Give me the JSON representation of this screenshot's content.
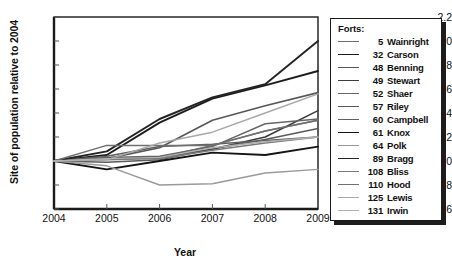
{
  "chart_data": {
    "type": "line",
    "title": "",
    "xlabel": "Year",
    "ylabel": "Site of population relative to 2004",
    "x": [
      2004,
      2005,
      2006,
      2007,
      2008,
      2009
    ],
    "xticklabels": [
      "2004",
      "2005",
      "2006",
      "2007",
      "2008",
      "2009"
    ],
    "yticklabels": [
      "0.6",
      "0.8",
      "1.0",
      "1.2",
      "1.4",
      "1.6",
      "1.8",
      "2.0",
      "2.2"
    ],
    "yticks": [
      0.6,
      0.8,
      1.0,
      1.2,
      1.4,
      1.6,
      1.8,
      2.0,
      2.2
    ],
    "xlim": [
      2004,
      2009
    ],
    "ylim": [
      0.6,
      2.2
    ],
    "grid": false,
    "legend_position": "right-outside",
    "legend_title": "Forts:",
    "series": [
      {
        "name": "5  Wainright",
        "number": "5",
        "fort": "Wainright",
        "color": "#6e6e6e",
        "width": 1.5,
        "values": [
          1.0,
          1.02,
          1.03,
          1.13,
          1.25,
          1.34
        ]
      },
      {
        "name": "32  Carson",
        "number": "32",
        "fort": "Carson",
        "color": "#1c1c1c",
        "width": 1.9,
        "values": [
          1.0,
          1.05,
          1.32,
          1.52,
          1.63,
          1.75
        ]
      },
      {
        "name": "48  Benning",
        "number": "48",
        "fort": "Benning",
        "color": "#5a5a5a",
        "width": 1.5,
        "values": [
          1.0,
          0.99,
          1.01,
          1.1,
          1.18,
          1.27
        ]
      },
      {
        "name": "49  Stewart",
        "number": "49",
        "fort": "Stewart",
        "color": "#3c3c3c",
        "width": 1.6,
        "values": [
          1.0,
          1.02,
          1.03,
          1.1,
          1.2,
          1.42
        ]
      },
      {
        "name": "52  Shaer",
        "number": "52",
        "fort": "Shaer",
        "color": "#666666",
        "width": 1.5,
        "values": [
          1.0,
          1.03,
          1.04,
          1.12,
          1.31,
          1.35
        ]
      },
      {
        "name": "57  Riley",
        "number": "57",
        "fort": "Riley",
        "color": "#575757",
        "width": 1.6,
        "values": [
          1.0,
          1.02,
          1.11,
          1.34,
          1.46,
          1.57
        ]
      },
      {
        "name": "60  Campbell",
        "number": "60",
        "fort": "Campbell",
        "color": "#606060",
        "width": 1.5,
        "values": [
          1.0,
          1.04,
          1.12,
          1.14,
          1.17,
          1.2
        ]
      },
      {
        "name": "61  Knox",
        "number": "61",
        "fort": "Knox",
        "color": "#141414",
        "width": 1.9,
        "values": [
          1.0,
          0.93,
          1.0,
          1.07,
          1.05,
          1.12
        ]
      },
      {
        "name": "64  Polk",
        "number": "64",
        "fort": "Polk",
        "color": "#9a9a9a",
        "width": 1.4,
        "values": [
          1.0,
          0.96,
          0.8,
          0.81,
          0.9,
          0.93
        ]
      },
      {
        "name": "89  Bragg",
        "number": "89",
        "fort": "Bragg",
        "color": "#242424",
        "width": 1.9,
        "values": [
          1.0,
          1.08,
          1.35,
          1.53,
          1.64,
          2.0
        ]
      },
      {
        "name": "108  Bliss",
        "number": "108",
        "fort": "Bliss",
        "color": "#7a7a7a",
        "width": 1.5,
        "values": [
          1.0,
          1.01,
          1.02,
          1.09,
          1.15,
          1.2
        ]
      },
      {
        "name": "110  Hood",
        "number": "110",
        "fort": "Hood",
        "color": "#707070",
        "width": 1.5,
        "values": [
          1.0,
          1.13,
          1.13,
          1.13,
          1.25,
          1.34
        ]
      },
      {
        "name": "125  Lewis",
        "number": "125",
        "fort": "Lewis",
        "color": "#a8a8a8",
        "width": 1.4,
        "values": [
          1.0,
          1.01,
          1.15,
          1.24,
          1.4,
          1.56
        ]
      },
      {
        "name": "131  Irwin",
        "number": "131",
        "fort": "Irwin",
        "color": "#b0b0b0",
        "width": 1.4,
        "values": [
          1.0,
          1.02,
          1.03,
          1.11,
          1.16,
          1.2
        ]
      }
    ]
  },
  "axes": {
    "frame_color": "#1a1a1a"
  }
}
